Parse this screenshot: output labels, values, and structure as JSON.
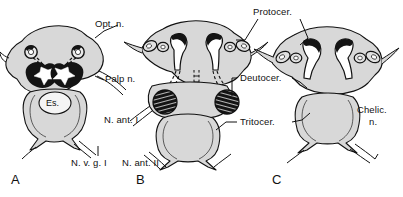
{
  "figure": {
    "background_color": "#ffffff",
    "ink_color": "#111111",
    "tissue_fill": "#d8d8d8",
    "tissue_fill_light": "#e6e6e6",
    "dark_structure": "#141414"
  },
  "panels": [
    {
      "id": "A",
      "letter": "A"
    },
    {
      "id": "B",
      "letter": "B"
    },
    {
      "id": "C",
      "letter": "C"
    }
  ],
  "labels": {
    "opt_n": "Opt. n.",
    "palp_n": "Palp n.",
    "n_ant_i": "N. ant. I",
    "n_v_g_i": "N. v. g. I",
    "n_ant_ii": "N. ant. II",
    "protocer": "Protocer.",
    "deutocer": "Deutocer.",
    "tritocer": "Tritocer.",
    "chelic_line1": "Chelic.",
    "chelic_line2": "n.",
    "es": "Es."
  }
}
